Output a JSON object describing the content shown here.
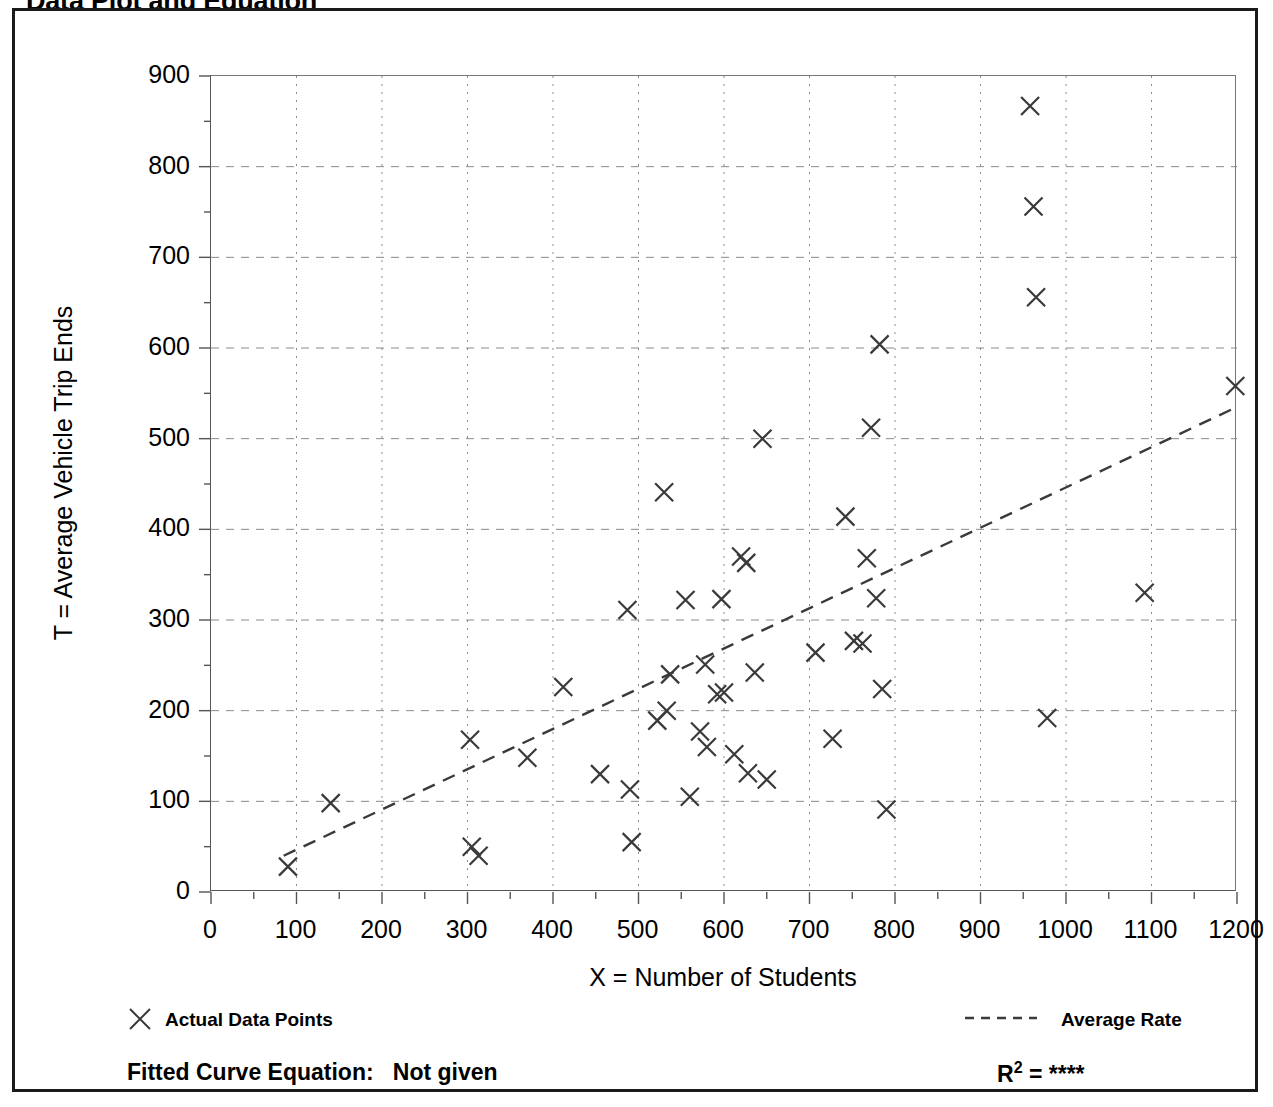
{
  "page_title": "Data Plot and Equation",
  "axes": {
    "y_label": "T = Average Vehicle Trip Ends",
    "x_label": "X = Number of Students",
    "y_ticks": [
      0,
      100,
      200,
      300,
      400,
      500,
      600,
      700,
      800,
      900
    ],
    "x_ticks": [
      0,
      100,
      200,
      300,
      400,
      500,
      600,
      700,
      800,
      900,
      1000,
      1100,
      1200
    ]
  },
  "legend": {
    "data_points_label": "Actual Data Points",
    "data_points_marker": "x-marker-icon",
    "average_rate_label": "Average Rate",
    "average_rate_marker": "dashed-line-icon"
  },
  "footer": {
    "fitted_curve_label": "Fitted Curve Equation:",
    "fitted_curve_value": "Not given",
    "r_squared_label": "R",
    "r_squared_exponent": "2",
    "r_squared_equals": "=",
    "r_squared_value": "****"
  },
  "colors": {
    "frame": "#1a1a1a",
    "marker": "#3a3a3a",
    "grid": "#8a8a8a",
    "trend_line": "#3a3a3a",
    "background": "#ffffff"
  },
  "chart_data": {
    "type": "scatter",
    "title": "Data Plot and Equation",
    "xlabel": "X = Number of Students",
    "ylabel": "T = Average Vehicle Trip Ends",
    "xlim": [
      0,
      1200
    ],
    "ylim": [
      0,
      900
    ],
    "x_major_step": 100,
    "y_major_step": 100,
    "x_minor_step": 50,
    "y_minor_step": 50,
    "grid": true,
    "grid_style": "dotted",
    "legend_position": "below-plot",
    "series": [
      {
        "name": "Actual Data Points",
        "type": "scatter",
        "marker": "x",
        "points": [
          [
            90,
            28
          ],
          [
            140,
            98
          ],
          [
            303,
            168
          ],
          [
            305,
            50
          ],
          [
            313,
            40
          ],
          [
            370,
            148
          ],
          [
            412,
            226
          ],
          [
            455,
            130
          ],
          [
            487,
            311
          ],
          [
            490,
            113
          ],
          [
            492,
            55
          ],
          [
            522,
            189
          ],
          [
            533,
            200
          ],
          [
            530,
            441
          ],
          [
            537,
            240
          ],
          [
            555,
            322
          ],
          [
            560,
            105
          ],
          [
            572,
            177
          ],
          [
            578,
            251
          ],
          [
            580,
            160
          ],
          [
            592,
            218
          ],
          [
            597,
            323
          ],
          [
            600,
            220
          ],
          [
            612,
            152
          ],
          [
            620,
            370
          ],
          [
            626,
            363
          ],
          [
            628,
            131
          ],
          [
            636,
            242
          ],
          [
            645,
            500
          ],
          [
            650,
            124
          ],
          [
            707,
            264
          ],
          [
            727,
            169
          ],
          [
            742,
            414
          ],
          [
            752,
            277
          ],
          [
            762,
            274
          ],
          [
            767,
            368
          ],
          [
            772,
            512
          ],
          [
            778,
            324
          ],
          [
            782,
            604
          ],
          [
            785,
            224
          ],
          [
            790,
            91
          ],
          [
            958,
            867
          ],
          [
            962,
            756
          ],
          [
            965,
            656
          ],
          [
            978,
            192
          ],
          [
            1092,
            330
          ],
          [
            1198,
            558
          ]
        ]
      },
      {
        "name": "Average Rate",
        "type": "line",
        "style": "dashed",
        "points": [
          [
            85,
            40
          ],
          [
            1200,
            535
          ]
        ]
      }
    ]
  }
}
